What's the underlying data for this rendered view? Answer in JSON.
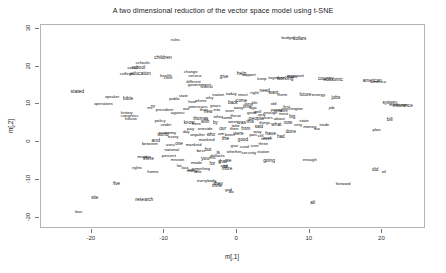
{
  "chart_data": {
    "type": "scatter",
    "title": "A two dimensional reduction of the vector space model using t-SNE",
    "xlabel": "m[,1]",
    "ylabel": "m[,2]",
    "grid": false,
    "legend": false,
    "xlim": [
      -27,
      26
    ],
    "ylim": [
      -23,
      31
    ],
    "xticks": [
      "-20",
      "-10",
      "0",
      "10",
      "20"
    ],
    "xtick_values": [
      -20,
      -10,
      0,
      10,
      20
    ],
    "yticks": [
      "30",
      "20",
      "10",
      "0",
      "-10",
      "-20"
    ],
    "ytick_values": [
      30,
      20,
      10,
      0,
      -10,
      -20
    ],
    "point_label_mode": "text",
    "note": "Each data point is rendered as the word itself at its embedding coordinate; central region is heavily overplotted.",
    "points": [
      {
        "t": "rules",
        "x": -8.5,
        "y": 27.0,
        "s": 4.2
      },
      {
        "t": "budget",
        "x": 7.0,
        "y": 27.6,
        "s": 4.2
      },
      {
        "t": "dollars",
        "x": 8.6,
        "y": 27.3,
        "s": 4.6
      },
      {
        "t": "children",
        "x": -10.2,
        "y": 22.6,
        "s": 5.0
      },
      {
        "t": "schools",
        "x": -13.0,
        "y": 21.0,
        "s": 4.2
      },
      {
        "t": "school",
        "x": -13.6,
        "y": 19.5,
        "s": 4.6
      },
      {
        "t": "social",
        "x": -14.4,
        "y": 19.6,
        "s": 4.2
      },
      {
        "t": "college",
        "x": -15.2,
        "y": 18.0,
        "s": 4.4
      },
      {
        "t": "education",
        "x": -13.3,
        "y": 17.9,
        "s": 4.8
      },
      {
        "t": "health",
        "x": -9.8,
        "y": 17.4,
        "s": 4.4
      },
      {
        "t": "care",
        "x": -9.5,
        "y": 17.0,
        "s": 4.4
      },
      {
        "t": "service",
        "x": -5.8,
        "y": 17.6,
        "s": 4.2
      },
      {
        "t": "give",
        "x": -1.8,
        "y": 17.3,
        "s": 4.6
      },
      {
        "t": "help",
        "x": 0.6,
        "y": 18.3,
        "s": 5.0
      },
      {
        "t": "support",
        "x": 1.6,
        "y": 17.7,
        "s": 4.2
      },
      {
        "t": "keep",
        "x": 3.4,
        "y": 16.6,
        "s": 4.2
      },
      {
        "t": "together",
        "x": 5.4,
        "y": 17.0,
        "s": 4.4
      },
      {
        "t": "working",
        "x": 6.6,
        "y": 16.8,
        "s": 4.8
      },
      {
        "t": "make",
        "x": 7.6,
        "y": 17.3,
        "s": 4.4
      },
      {
        "t": "important",
        "x": 8.0,
        "y": 17.6,
        "s": 4.2
      },
      {
        "t": "change",
        "x": -6.4,
        "y": 18.6,
        "s": 4.2
      },
      {
        "t": "different",
        "x": -6.0,
        "y": 16.0,
        "s": 4.0
      },
      {
        "t": "government",
        "x": -5.2,
        "y": 15.2,
        "s": 4.4
      },
      {
        "t": "federal",
        "x": -4.2,
        "y": 14.6,
        "s": 4.0
      },
      {
        "t": "economic",
        "x": 13.2,
        "y": 16.4,
        "s": 4.6
      },
      {
        "t": "country",
        "x": 12.2,
        "y": 16.6,
        "s": 4.8
      },
      {
        "t": "american",
        "x": 18.6,
        "y": 16.2,
        "s": 4.6
      },
      {
        "t": "america",
        "x": 19.4,
        "y": 16.0,
        "s": 4.4
      },
      {
        "t": "stated",
        "x": -22.0,
        "y": 13.6,
        "s": 5.0
      },
      {
        "t": "speaker",
        "x": -17.2,
        "y": 12.0,
        "s": 4.0
      },
      {
        "t": "bible",
        "x": -15.0,
        "y": 11.4,
        "s": 4.8
      },
      {
        "t": "operations",
        "x": -18.4,
        "y": 10.0,
        "s": 4.0
      },
      {
        "t": "future",
        "x": 9.4,
        "y": 12.4,
        "s": 4.6
      },
      {
        "t": "energy",
        "x": 11.2,
        "y": 12.6,
        "s": 4.4
      },
      {
        "t": "jobs",
        "x": 13.6,
        "y": 11.6,
        "s": 4.8
      },
      {
        "t": "job",
        "x": 13.0,
        "y": 9.0,
        "s": 4.4
      },
      {
        "t": "system",
        "x": 21.0,
        "y": 10.4,
        "s": 4.6
      },
      {
        "t": "insurance",
        "x": 22.8,
        "y": 9.6,
        "s": 4.6
      },
      {
        "t": "medicare",
        "x": 22.2,
        "y": 9.8,
        "s": 4.4
      },
      {
        "t": "washington",
        "x": 7.6,
        "y": 8.8,
        "s": 4.2
      },
      {
        "t": "young",
        "x": 5.4,
        "y": 8.6,
        "s": 4.2
      },
      {
        "t": "children2",
        "x": 6.0,
        "y": 8.2,
        "s": 4.0
      },
      {
        "t": "old",
        "x": 5.0,
        "y": 10.0,
        "s": 4.2
      },
      {
        "t": "enough2",
        "x": 4.6,
        "y": 7.8,
        "s": 4.0
      },
      {
        "t": "big",
        "x": 7.6,
        "y": 6.6,
        "s": 4.6
      },
      {
        "t": "000",
        "x": 11.0,
        "y": 6.6,
        "s": 4.4
      },
      {
        "t": "bill",
        "x": 21.0,
        "y": 5.8,
        "s": 4.8
      },
      {
        "t": "plan",
        "x": 19.2,
        "y": 3.2,
        "s": 4.4
      },
      {
        "t": "history",
        "x": -15.2,
        "y": 7.6,
        "s": 4.0
      },
      {
        "t": "house",
        "x": -14.6,
        "y": 6.0,
        "s": 4.4
      },
      {
        "t": "congress",
        "x": -14.8,
        "y": 6.8,
        "s": 4.4
      },
      {
        "t": "president",
        "x": -10.0,
        "y": 8.6,
        "s": 4.2
      },
      {
        "t": "ny",
        "x": -11.6,
        "y": 9.6,
        "s": 4.0
      },
      {
        "t": "ms",
        "x": -12.0,
        "y": 9.0,
        "s": 4.0
      },
      {
        "t": "against",
        "x": -8.2,
        "y": 7.8,
        "s": 4.2
      },
      {
        "t": "war",
        "x": -7.0,
        "y": 8.8,
        "s": 4.2
      },
      {
        "t": "americans",
        "x": -5.4,
        "y": 9.4,
        "s": 4.2
      },
      {
        "t": "years",
        "x": -3.0,
        "y": 9.6,
        "s": 4.4
      },
      {
        "t": "back",
        "x": -0.6,
        "y": 10.4,
        "s": 4.6
      },
      {
        "t": "come",
        "x": 0.6,
        "y": 10.8,
        "s": 4.6
      },
      {
        "t": "long",
        "x": 1.6,
        "y": 10.2,
        "s": 4.4
      },
      {
        "t": "life",
        "x": 2.4,
        "y": 10.4,
        "s": 4.4
      },
      {
        "t": "away",
        "x": 0.2,
        "y": 9.0,
        "s": 4.2
      },
      {
        "t": "time",
        "x": 1.4,
        "y": 9.2,
        "s": 4.6
      },
      {
        "t": "ago",
        "x": 2.2,
        "y": 9.0,
        "s": 4.2
      },
      {
        "t": "into",
        "x": -2.8,
        "y": 8.4,
        "s": 4.2
      },
      {
        "t": "over",
        "x": -1.0,
        "y": 8.2,
        "s": 4.4
      },
      {
        "t": "new",
        "x": -4.0,
        "y": 8.0,
        "s": 4.6
      },
      {
        "t": "than",
        "x": -4.6,
        "y": 8.4,
        "s": 4.2
      },
      {
        "t": "thomas",
        "x": -5.0,
        "y": 6.2,
        "s": 4.6
      },
      {
        "t": "know",
        "x": -6.6,
        "y": 5.0,
        "s": 4.6
      },
      {
        "t": "here",
        "x": -5.6,
        "y": 4.8,
        "s": 4.4
      },
      {
        "t": "with",
        "x": -4.4,
        "y": 5.2,
        "s": 4.6
      },
      {
        "t": "by",
        "x": -3.0,
        "y": 5.0,
        "s": 4.6
      },
      {
        "t": "went",
        "x": -0.6,
        "y": 5.4,
        "s": 4.4
      },
      {
        "t": "was",
        "x": 0.6,
        "y": 5.2,
        "s": 5.0
      },
      {
        "t": "this",
        "x": 1.8,
        "y": 5.4,
        "s": 4.8
      },
      {
        "t": "pay",
        "x": -6.4,
        "y": 3.4,
        "s": 4.4
      },
      {
        "t": "oneside",
        "x": -4.4,
        "y": 3.4,
        "s": 4.2
      },
      {
        "t": "our",
        "x": -2.0,
        "y": 3.6,
        "s": 4.8
      },
      {
        "t": "then",
        "x": -0.4,
        "y": 3.4,
        "s": 4.4
      },
      {
        "t": "from",
        "x": 1.2,
        "y": 3.6,
        "s": 4.6
      },
      {
        "t": "any",
        "x": -6.0,
        "y": 2.0,
        "s": 4.2
      },
      {
        "t": "after",
        "x": -5.0,
        "y": 1.8,
        "s": 4.2
      },
      {
        "t": "who",
        "x": -3.6,
        "y": 2.0,
        "s": 4.6
      },
      {
        "t": "am",
        "x": -2.2,
        "y": 2.2,
        "s": 4.4
      },
      {
        "t": "been",
        "x": -1.0,
        "y": 2.0,
        "s": 4.4
      },
      {
        "t": "were",
        "x": 0.2,
        "y": 2.2,
        "s": 4.6
      },
      {
        "t": "mankind",
        "x": -4.2,
        "y": 0.6,
        "s": 4.2
      },
      {
        "t": "the",
        "x": -1.6,
        "y": 0.8,
        "s": 5.2
      },
      {
        "t": "good",
        "x": 0.8,
        "y": 0.6,
        "s": 4.6
      },
      {
        "t": "part",
        "x": 2.2,
        "y": 1.8,
        "s": 4.2
      },
      {
        "t": "still",
        "x": 3.2,
        "y": 1.6,
        "s": 4.2
      },
      {
        "t": "have",
        "x": 4.6,
        "y": 2.4,
        "s": 5.0
      },
      {
        "t": "done",
        "x": 7.4,
        "y": 2.6,
        "s": 4.6
      },
      {
        "t": "had",
        "x": 6.0,
        "y": 1.4,
        "s": 4.6
      },
      {
        "t": "work",
        "x": 4.2,
        "y": 1.2,
        "s": 4.4
      },
      {
        "t": "never",
        "x": 4.0,
        "y": 0.8,
        "s": 4.2
      },
      {
        "t": "economy",
        "x": -9.6,
        "y": 2.4,
        "s": 4.4
      },
      {
        "t": "world",
        "x": -10.2,
        "y": 1.8,
        "s": 4.6
      },
      {
        "t": "every",
        "x": -8.8,
        "y": 1.4,
        "s": 4.4
      },
      {
        "t": "and",
        "x": -11.2,
        "y": 0.6,
        "s": 5.0
      },
      {
        "t": "between",
        "x": -12.0,
        "y": -0.4,
        "s": 4.2
      },
      {
        "t": "area",
        "x": -9.2,
        "y": -0.8,
        "s": 4.2
      },
      {
        "t": "one",
        "x": -8.0,
        "y": -0.6,
        "s": 4.6
      },
      {
        "t": "mankind2",
        "x": -6.0,
        "y": -0.8,
        "s": 4.2
      },
      {
        "t": "12",
        "x": -11.0,
        "y": -3.2,
        "s": 4.2
      },
      {
        "t": "percent",
        "x": -9.4,
        "y": -3.6,
        "s": 4.2
      },
      {
        "t": "best",
        "x": -5.0,
        "y": -2.4,
        "s": 4.4
      },
      {
        "t": "there",
        "x": -12.2,
        "y": -4.4,
        "s": 4.8
      },
      {
        "t": "maybe",
        "x": -12.8,
        "y": -4.0,
        "s": 4.4
      },
      {
        "t": "dollar",
        "x": -3.0,
        "y": -3.6,
        "s": 4.2
      },
      {
        "t": "made",
        "x": -5.6,
        "y": -5.4,
        "s": 4.4
      },
      {
        "t": "national",
        "x": -9.0,
        "y": -2.0,
        "s": 4.2
      },
      {
        "t": "mission",
        "x": -8.2,
        "y": -4.8,
        "s": 4.0
      },
      {
        "t": "whether",
        "x": -0.4,
        "y": -2.6,
        "s": 4.2
      },
      {
        "t": "security",
        "x": 1.6,
        "y": -2.8,
        "s": 4.4
      },
      {
        "t": "station",
        "x": 3.6,
        "y": -2.6,
        "s": 4.0
      },
      {
        "t": "but",
        "x": -4.0,
        "y": -2.2,
        "s": 4.6
      },
      {
        "t": "is",
        "x": -2.6,
        "y": -2.8,
        "s": 4.8
      },
      {
        "t": "its",
        "x": -2.0,
        "y": -3.6,
        "s": 4.4
      },
      {
        "t": "you",
        "x": -4.4,
        "y": -4.6,
        "s": 5.2
      },
      {
        "t": "this2",
        "x": -3.4,
        "y": -4.2,
        "s": 4.2
      },
      {
        "t": "that",
        "x": -2.0,
        "y": -5.0,
        "s": 5.0
      },
      {
        "t": "we",
        "x": -1.2,
        "y": -5.0,
        "s": 4.8
      },
      {
        "t": "for",
        "x": -3.4,
        "y": -5.8,
        "s": 4.8
      },
      {
        "t": "it",
        "x": -2.4,
        "y": -5.6,
        "s": 4.6
      },
      {
        "t": "to",
        "x": -1.6,
        "y": -6.2,
        "s": 5.0
      },
      {
        "t": "and2",
        "x": -1.8,
        "y": -6.4,
        "s": 4.4
      },
      {
        "t": "more",
        "x": -1.4,
        "y": -7.0,
        "s": 4.6
      },
      {
        "t": "going",
        "x": 4.4,
        "y": -5.0,
        "s": 4.8
      },
      {
        "t": "enough",
        "x": 10.0,
        "y": -4.8,
        "s": 4.2
      },
      {
        "t": "rights",
        "x": -13.8,
        "y": -6.8,
        "s": 4.0
      },
      {
        "t": "lot",
        "x": -8.0,
        "y": -6.2,
        "s": 4.2
      },
      {
        "t": "last",
        "x": -7.2,
        "y": -6.8,
        "s": 4.2
      },
      {
        "t": "law",
        "x": -6.4,
        "y": -7.4,
        "s": 4.2
      },
      {
        "t": "home",
        "x": -11.6,
        "y": -7.8,
        "s": 4.4
      },
      {
        "t": "many",
        "x": -6.2,
        "y": -7.6,
        "s": 4.4
      },
      {
        "t": "little",
        "x": -5.4,
        "y": -8.0,
        "s": 4.2
      },
      {
        "t": "something",
        "x": -5.0,
        "y": -7.0,
        "s": 4.0
      },
      {
        "t": "everybody",
        "x": -4.2,
        "y": -10.4,
        "s": 4.2
      },
      {
        "t": "they",
        "x": -2.6,
        "y": -11.0,
        "s": 4.8
      },
      {
        "t": "think",
        "x": -2.8,
        "y": -11.6,
        "s": 4.6
      },
      {
        "t": "god",
        "x": -1.2,
        "y": -12.6,
        "s": 4.2
      },
      {
        "t": "do",
        "x": -0.8,
        "y": -13.2,
        "s": 4.4
      },
      {
        "t": "five",
        "x": -16.6,
        "y": -11.0,
        "s": 4.6
      },
      {
        "t": "site",
        "x": -19.6,
        "y": -14.8,
        "s": 4.6
      },
      {
        "t": "research",
        "x": -12.8,
        "y": -15.4,
        "s": 4.6
      },
      {
        "t": "forward",
        "x": 14.6,
        "y": -11.2,
        "s": 4.4
      },
      {
        "t": "ali",
        "x": 10.4,
        "y": -16.2,
        "s": 4.8
      },
      {
        "t": "bus",
        "x": -21.8,
        "y": -18.6,
        "s": 4.4
      },
      {
        "t": "oil",
        "x": 20.2,
        "y": -7.8,
        "s": 4.4
      },
      {
        "t": "did",
        "x": 19.0,
        "y": -7.4,
        "s": 4.6
      },
      {
        "t": "tax",
        "x": 11.0,
        "y": 3.4,
        "s": 4.4
      },
      {
        "t": "trade",
        "x": 12.0,
        "y": 4.6,
        "s": 4.2
      },
      {
        "t": "money",
        "x": 10.0,
        "y": 4.0,
        "s": 4.4
      },
      {
        "t": "very",
        "x": 8.4,
        "y": 4.4,
        "s": 4.4
      },
      {
        "t": "state",
        "x": 9.2,
        "y": 5.6,
        "s": 4.4
      },
      {
        "t": "now",
        "x": 7.0,
        "y": 5.0,
        "s": 4.6
      },
      {
        "t": "what",
        "x": 5.4,
        "y": 4.6,
        "s": 4.8
      },
      {
        "t": "things",
        "x": 3.8,
        "y": 5.0,
        "s": 4.2
      },
      {
        "t": "said",
        "x": 3.0,
        "y": 4.0,
        "s": 4.6
      },
      {
        "t": "people",
        "x": 2.6,
        "y": 6.0,
        "s": 4.8
      },
      {
        "t": "years2",
        "x": 4.2,
        "y": 6.4,
        "s": 4.2
      },
      {
        "t": "about",
        "x": 5.8,
        "y": 6.0,
        "s": 4.4
      },
      {
        "t": "only",
        "x": 3.4,
        "y": 7.2,
        "s": 4.2
      },
      {
        "t": "good2",
        "x": 2.0,
        "y": 7.6,
        "s": 4.2
      },
      {
        "t": "well",
        "x": 2.8,
        "y": 8.0,
        "s": 4.4
      },
      {
        "t": "most",
        "x": 6.4,
        "y": 7.4,
        "s": 4.2
      },
      {
        "t": "first",
        "x": 6.8,
        "y": 9.4,
        "s": 4.2
      },
      {
        "t": "public",
        "x": -8.6,
        "y": 11.4,
        "s": 4.2
      },
      {
        "t": "state2",
        "x": -7.4,
        "y": 12.2,
        "s": 4.2
      },
      {
        "t": "nation",
        "x": -2.6,
        "y": 12.4,
        "s": 4.4
      },
      {
        "t": "today",
        "x": -0.8,
        "y": 12.8,
        "s": 4.4
      },
      {
        "t": "must",
        "x": 0.8,
        "y": 12.6,
        "s": 4.4
      },
      {
        "t": "right",
        "x": 2.4,
        "y": 13.0,
        "s": 4.4
      },
      {
        "t": "need",
        "x": 3.8,
        "y": 13.4,
        "s": 4.6
      },
      {
        "t": "want",
        "x": 5.0,
        "y": 13.0,
        "s": 4.6
      },
      {
        "t": "them",
        "x": 6.2,
        "y": 12.4,
        "s": 4.4
      },
      {
        "t": "why",
        "x": -3.8,
        "y": 11.6,
        "s": 4.2
      },
      {
        "t": "where",
        "x": -5.0,
        "y": 11.0,
        "s": 4.2
      },
      {
        "t": "how",
        "x": -6.2,
        "y": 10.6,
        "s": 4.2
      },
      {
        "t": "these",
        "x": -0.2,
        "y": 6.8,
        "s": 4.4
      },
      {
        "t": "some",
        "x": -1.4,
        "y": 6.4,
        "s": 4.4
      },
      {
        "t": "other",
        "x": -2.6,
        "y": 6.6,
        "s": 4.2
      },
      {
        "t": "take",
        "x": -0.2,
        "y": 4.2,
        "s": 4.2
      },
      {
        "t": "day",
        "x": -7.0,
        "y": 2.8,
        "s": 4.2
      },
      {
        "t": "way",
        "x": 2.8,
        "y": 2.6,
        "s": 4.4
      },
      {
        "t": "three",
        "x": 3.6,
        "y": -0.4,
        "s": 4.2
      },
      {
        "t": "sure",
        "x": 2.4,
        "y": -1.0,
        "s": 4.2
      },
      {
        "t": "used",
        "x": 1.0,
        "y": -1.2,
        "s": 4.2
      },
      {
        "t": "give2",
        "x": -0.4,
        "y": -1.0,
        "s": 4.2
      },
      {
        "t": "under",
        "x": -9.8,
        "y": 4.6,
        "s": 4.2
      },
      {
        "t": "policy",
        "x": -10.6,
        "y": 5.6,
        "s": 4.2
      }
    ]
  }
}
